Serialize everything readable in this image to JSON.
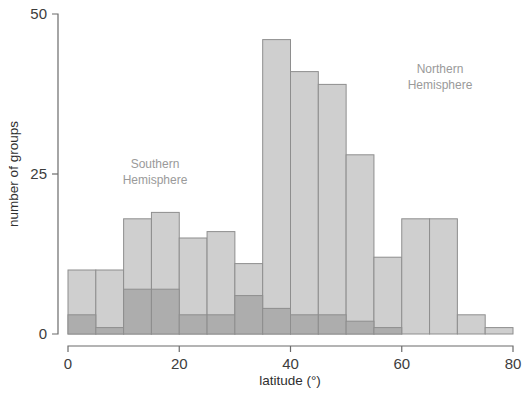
{
  "figure": {
    "background": "#ffffff",
    "annotations": [
      {
        "name": "southern-hemisphere-label",
        "line1": "Southern",
        "line2": "Hemisphere",
        "x": 155,
        "y": 168
      },
      {
        "name": "northern-hemisphere-label",
        "line1": "Northern",
        "line2": "Hemisphere",
        "x": 440,
        "y": 73
      }
    ]
  },
  "chart_data": {
    "type": "bar",
    "subtype": "stacked-histogram",
    "title": "",
    "xlabel": "latitude (°)",
    "ylabel": "number of groups",
    "xlim": [
      0,
      80
    ],
    "ylim": [
      0,
      50
    ],
    "bin_width": 5,
    "xticks": [
      0,
      20,
      40,
      60,
      80
    ],
    "xticklabels": [
      "0",
      "20",
      "40",
      "60",
      "80"
    ],
    "yticks": [
      0,
      25,
      50
    ],
    "yticklabels": [
      "0",
      "25",
      "50"
    ],
    "grid": false,
    "legend": "annotations-in-plot",
    "bin_starts": [
      0,
      5,
      10,
      15,
      20,
      25,
      30,
      35,
      40,
      45,
      50,
      55,
      60,
      65,
      70,
      75
    ],
    "bin_labels": [
      "0–5",
      "5–10",
      "10–15",
      "15–20",
      "20–25",
      "25–30",
      "30–35",
      "35–40",
      "40–45",
      "45–50",
      "50–55",
      "55–60",
      "60–65",
      "65–70",
      "70–75",
      "75–80"
    ],
    "series": [
      {
        "name": "Total (all groups)",
        "color": "#cfcfcf",
        "edge": "#8e8e8e",
        "values": [
          10,
          10,
          18,
          19,
          15,
          16,
          11,
          46,
          41,
          39,
          28,
          12,
          18,
          18,
          3,
          1
        ]
      },
      {
        "name": "Southern Hemisphere",
        "color": "#adadad",
        "edge": "#8e8e8e",
        "values": [
          3,
          1,
          7,
          7,
          3,
          3,
          6,
          4,
          3,
          3,
          2,
          1,
          0,
          0,
          0,
          0
        ]
      }
    ]
  },
  "plot_geometry": {
    "x_px_at_0": 68,
    "x_px_at_80": 513,
    "y_px_at_0": 334,
    "y_px_at_50": 14
  }
}
